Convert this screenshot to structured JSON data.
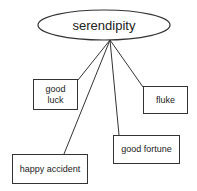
{
  "diagram": {
    "center": {
      "label": "serendipity"
    },
    "nodes": [
      {
        "id": "good-luck",
        "label": "good luck"
      },
      {
        "id": "fluke",
        "label": "fluke"
      },
      {
        "id": "good-fortune",
        "label": "good fortune"
      },
      {
        "id": "happy-accident",
        "label": "happy accident"
      }
    ],
    "colors": {
      "stroke": "#333333",
      "background": "#ffffff"
    }
  }
}
